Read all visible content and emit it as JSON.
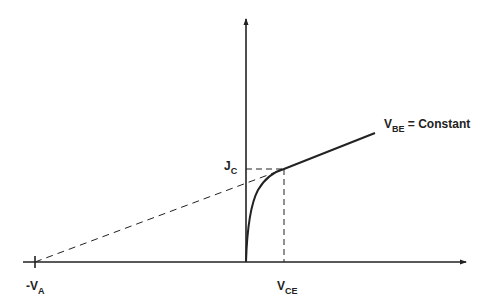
{
  "diagram": {
    "type": "bjt-output-characteristic-early-effect",
    "labels": {
      "neg_va_prefix": "-V",
      "neg_va_sub": "A",
      "jc_main": "J",
      "jc_sub": "C",
      "vce_main": "V",
      "vce_sub": "CE",
      "vbe_main": "V",
      "vbe_sub": "BE",
      "vbe_suffix": " = Constant"
    },
    "colors": {
      "line": "#222222",
      "background": "#ffffff"
    }
  }
}
